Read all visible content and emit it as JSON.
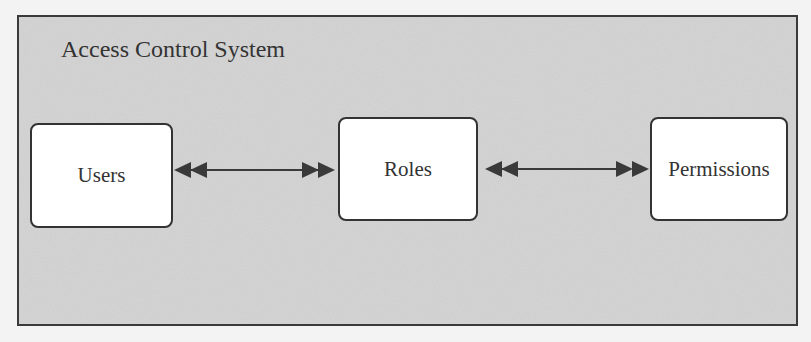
{
  "diagram": {
    "title": "Access Control System",
    "nodes": [
      {
        "id": "users",
        "label": "Users"
      },
      {
        "id": "roles",
        "label": "Roles"
      },
      {
        "id": "permissions",
        "label": "Permissions"
      }
    ],
    "edges": [
      {
        "from": "users",
        "to": "roles",
        "type": "bidirectional-double-arrow"
      },
      {
        "from": "roles",
        "to": "permissions",
        "type": "bidirectional-double-arrow"
      }
    ],
    "colors": {
      "frame_border": "#3a3a3a",
      "frame_fill": "#d9d9d9",
      "node_fill": "#ffffff",
      "stroke": "#333333"
    }
  }
}
